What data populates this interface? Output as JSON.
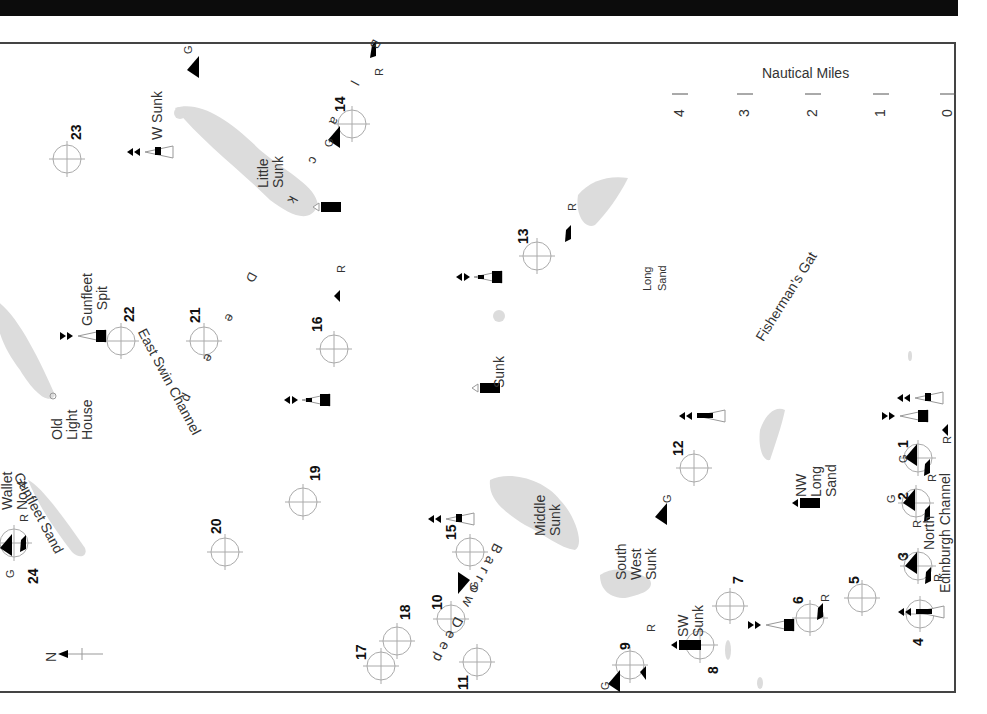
{
  "map": {
    "title_bar_color": "#0c0c0c",
    "scale": {
      "title": "Nautical Miles",
      "ticks": [
        "4",
        "3",
        "2",
        "1",
        "0"
      ]
    },
    "north_label": "N",
    "channels": {
      "east_swin": "East Swin Channel",
      "barrow_deep": "Barrow Deep",
      "black_deep": "Black Deep",
      "fishermans_gat": "Fisherman's Gat",
      "north_edinburgh": "North Edinburgh Channel"
    },
    "sandbanks": {
      "gunfleet_sand": "Gunfleet Sand",
      "little_sunk": "Little Sunk",
      "middle_sunk": "Middle Sunk",
      "south_west_sunk": "South West Sunk",
      "long_sand": "Long Sand"
    },
    "buoy_labels": {
      "w_sunk": "W Sunk",
      "gunfleet_spit": "Gunfleet Spit",
      "old_lighthouse": "Old Light House",
      "wallet_no4": "Wallet No 4",
      "little_sunk_buoy": "Little Sunk",
      "sunk": "Sunk",
      "nw_long_sand": "NW Long Sand",
      "sw_sunk": "SW Sunk",
      "north": "North",
      "edinburgh_channel": "Edinburgh Channel"
    },
    "waypoints": [
      {
        "n": "1",
        "x": 918,
        "y": 458
      },
      {
        "n": "2",
        "x": 916,
        "y": 503
      },
      {
        "n": "3",
        "x": 918,
        "y": 566
      },
      {
        "n": "4",
        "x": 920,
        "y": 614
      },
      {
        "n": "5",
        "x": 862,
        "y": 598
      },
      {
        "n": "6",
        "x": 810,
        "y": 618
      },
      {
        "n": "7",
        "x": 730,
        "y": 606
      },
      {
        "n": "8",
        "x": 700,
        "y": 645
      },
      {
        "n": "9",
        "x": 630,
        "y": 665
      },
      {
        "n": "10",
        "x": 451,
        "y": 619
      },
      {
        "n": "11",
        "x": 477,
        "y": 662
      },
      {
        "n": "12",
        "x": 694,
        "y": 468
      },
      {
        "n": "13",
        "x": 537,
        "y": 256
      },
      {
        "n": "14",
        "x": 352,
        "y": 124
      },
      {
        "n": "15",
        "x": 470,
        "y": 552
      },
      {
        "n": "16",
        "x": 334,
        "y": 349
      },
      {
        "n": "17",
        "x": 381,
        "y": 666
      },
      {
        "n": "18",
        "x": 397,
        "y": 641
      },
      {
        "n": "19",
        "x": 303,
        "y": 502
      },
      {
        "n": "20",
        "x": 225,
        "y": 552
      },
      {
        "n": "21",
        "x": 204,
        "y": 341
      },
      {
        "n": "22",
        "x": 121,
        "y": 341
      },
      {
        "n": "23",
        "x": 67,
        "y": 159
      },
      {
        "n": "24",
        "x": 14,
        "y": 543
      }
    ],
    "marker_letters": {
      "green": "G",
      "red": "R"
    }
  }
}
